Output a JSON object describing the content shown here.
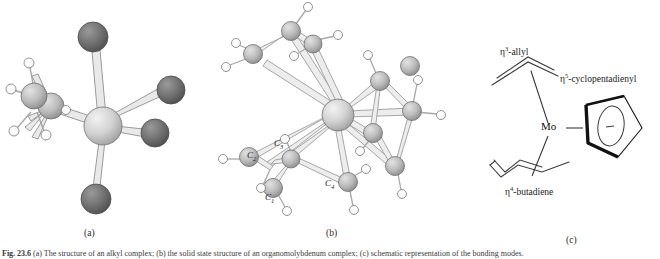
{
  "figure": {
    "caption_number": "Fig. 23.6",
    "caption_text": "(a) The structure of an alkyl complex; (b) the solid state structure of an organomolybdenum complex; (c) schematic representation of the bonding modes.",
    "panels": [
      {
        "id": "a",
        "label": "(a)",
        "kind": "ball-and-stick",
        "description": "Metal centre with four dark substituent atoms and one ethyl group"
      },
      {
        "id": "b",
        "label": "(b)",
        "kind": "ball-and-stick",
        "description": "Molybdenum centre bearing allyl, butadiene and cyclopentadienyl ligands",
        "atom_labels": [
          {
            "element": "C",
            "index": "1"
          },
          {
            "element": "C",
            "index": "2"
          },
          {
            "element": "C",
            "index": "3"
          },
          {
            "element": "C",
            "index": "4"
          }
        ]
      },
      {
        "id": "c",
        "label": "(c)",
        "kind": "line-drawing",
        "metal": "Mo",
        "ligands": [
          {
            "eta": "3",
            "name": "allyl",
            "prefix": "η",
            "text": "-allyl"
          },
          {
            "eta": "5",
            "name": "cyclopentadienyl",
            "prefix": "η",
            "text": "-cyclopentadienyl"
          },
          {
            "eta": "4",
            "name": "butadiene",
            "prefix": "η",
            "text": "-butadiene"
          }
        ]
      }
    ]
  },
  "colors": {
    "dark_atom": "#6f6f6f",
    "metal_atom": "#cfcfcf",
    "carbon_atom": "#a8a8a8",
    "hydrogen_atom": "#ffffff",
    "bond_stroke": "#8a8a8a",
    "outline": "#4a4a4a",
    "line_drawing": "#3a3a3a",
    "background": "#ffffff"
  }
}
